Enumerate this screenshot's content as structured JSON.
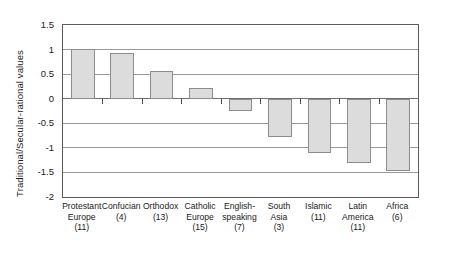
{
  "chart_data": {
    "type": "bar",
    "title": "",
    "subtitle": "",
    "xlabel": "",
    "ylabel": "Traditional/Secular-rational values",
    "ylim": [
      -2,
      1.5
    ],
    "yticks": [
      1.5,
      1,
      0.5,
      0,
      -0.5,
      -1,
      -1.5,
      -2
    ],
    "ytick_labels": [
      "1.5",
      "1",
      "0.5",
      "0",
      "-0.5",
      "-1",
      "-1.5",
      "-2"
    ],
    "grid": true,
    "legend": null,
    "categories": [
      "Protestant Europe (11)",
      "Confucian (4)",
      "Orthodox (13)",
      "Catholic Europe (15)",
      "English-speaking (7)",
      "South Asia (3)",
      "Islamic (11)",
      "Latin America (11)",
      "Africa (6)"
    ],
    "category_lines": [
      [
        "Protestant",
        "Europe",
        "(11)"
      ],
      [
        "Confucian",
        "(4)"
      ],
      [
        "Orthodox",
        "(13)"
      ],
      [
        "Catholic",
        "Europe",
        "(15)"
      ],
      [
        "English-",
        "speaking",
        "(7)"
      ],
      [
        "South",
        "Asia",
        "(3)"
      ],
      [
        "Islamic",
        "(11)"
      ],
      [
        "Latin",
        "America",
        "(11)"
      ],
      [
        "Africa",
        "(6)"
      ]
    ],
    "values": [
      1.01,
      0.93,
      0.57,
      0.22,
      -0.25,
      -0.78,
      -1.1,
      -1.3,
      -1.48
    ],
    "colors": {
      "bar_fill": "#dcdcdc",
      "bar_border": "#8c8c8c",
      "gridline": "#9a9a9a",
      "axis": "#5b5b5b",
      "text": "#1a1a1a",
      "background": "#ffffff"
    }
  }
}
